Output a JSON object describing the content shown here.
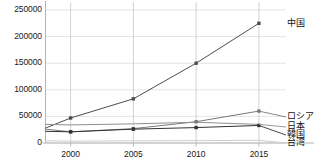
{
  "chart_data": {
    "type": "line",
    "title": "",
    "subtitle": "",
    "xlabel": "",
    "ylabel": "",
    "x": [
      1998,
      2000,
      2005,
      2010,
      2015
    ],
    "xlim": [
      1998,
      2017
    ],
    "ylim": [
      0,
      250000
    ],
    "grid": "vertical-major-and-horizontal-light",
    "legend_position": "right-of-plot-at-series-end",
    "xticks": [
      2000,
      2005,
      2010,
      2015
    ],
    "xticklabels": [
      "2000",
      "2005",
      "2010",
      "2015"
    ],
    "yticks": [
      0,
      50000,
      100000,
      150000,
      200000,
      250000
    ],
    "yticklabels": [
      "0",
      "50000",
      "100000",
      "150000",
      "200000",
      "250000"
    ],
    "series": [
      {
        "name": "中国",
        "color": "#4d4d4d",
        "values": [
          28000,
          47000,
          83000,
          150000,
          225000
        ]
      },
      {
        "name": "ロシア",
        "color": "#7a7a7a",
        "values": [
          26000,
          21000,
          27000,
          40000,
          60000
        ]
      },
      {
        "name": "日本",
        "color": "#8f8f8f",
        "values": [
          35000,
          34000,
          36000,
          39000,
          35000
        ]
      },
      {
        "name": "韓国",
        "color": "#333333",
        "values": [
          22000,
          21000,
          26000,
          29000,
          33000
        ]
      },
      {
        "name": "台湾",
        "color": "#c8c8c8",
        "values": [
          4000,
          3500,
          4000,
          4500,
          5000
        ]
      }
    ]
  },
  "axis": {
    "axis_color": "#b4b4b4",
    "gridline_color": "#c8c8c8",
    "tick_color": "#aaaaaa",
    "label_color": "#1a1a1a"
  }
}
